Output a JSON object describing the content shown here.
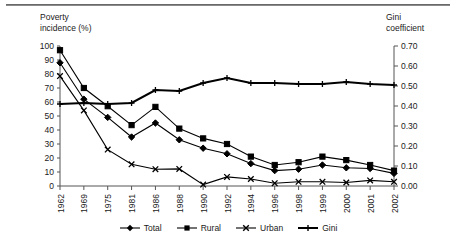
{
  "figure": {
    "left_axis_title": "Poverty\nincidence (%)",
    "right_axis_title": "Gini\ncoefficient"
  },
  "chart_data": {
    "type": "line",
    "title": "",
    "xlabel": "",
    "ylabel": "Poverty incidence (%)",
    "y2label": "Gini coefficient",
    "ylim": [
      0,
      100
    ],
    "y2lim": [
      0.0,
      0.7
    ],
    "ytick_labels": [
      "100",
      "90",
      "80",
      "70",
      "60",
      "50",
      "40",
      "30",
      "20",
      "10",
      "0"
    ],
    "ytick_values": [
      100,
      90,
      80,
      70,
      60,
      50,
      40,
      30,
      20,
      10,
      0
    ],
    "y2tick_labels": [
      "0.70",
      "0.60",
      "0.50",
      "0.40",
      "0.30",
      "0.20",
      "0.10",
      "0.00"
    ],
    "y2tick_values": [
      0.7,
      0.6,
      0.5,
      0.4,
      0.3,
      0.2,
      0.1,
      0.0
    ],
    "grid": false,
    "legend_position": "bottom",
    "categories": [
      "1962",
      "1969",
      "1975",
      "1981",
      "1986",
      "1988",
      "1990",
      "1992",
      "1994",
      "1996",
      "1998",
      "1999",
      "2000",
      "2001",
      "2002"
    ],
    "series": [
      {
        "name": "Total",
        "axis": "left",
        "marker": "diamond",
        "values": [
          88,
          62,
          49,
          35,
          45,
          33,
          27,
          23,
          16,
          11,
          12,
          15,
          13,
          12.5,
          9
        ]
      },
      {
        "name": "Rural",
        "axis": "left",
        "marker": "square",
        "values": [
          97,
          70,
          57,
          43.5,
          56.5,
          41,
          34,
          30,
          21,
          15,
          17,
          21,
          18.5,
          15,
          11
        ]
      },
      {
        "name": "Urban",
        "axis": "left",
        "marker": "x",
        "values": [
          78.5,
          54,
          26,
          15.5,
          12,
          12.2,
          1,
          6.5,
          5,
          2,
          3,
          3,
          2.5,
          4,
          3
        ]
      },
      {
        "name": "Gini",
        "axis": "right",
        "marker": "plus",
        "values": [
          0.41,
          0.415,
          0.41,
          0.415,
          0.48,
          0.475,
          0.515,
          0.54,
          0.515,
          0.515,
          0.51,
          0.51,
          0.52,
          0.51,
          0.505
        ]
      }
    ]
  },
  "legend": {
    "items": [
      {
        "label": "Total",
        "marker": "diamond"
      },
      {
        "label": "Rural",
        "marker": "square"
      },
      {
        "label": "Urban",
        "marker": "x"
      },
      {
        "label": "Gini",
        "marker": "plus"
      }
    ]
  }
}
